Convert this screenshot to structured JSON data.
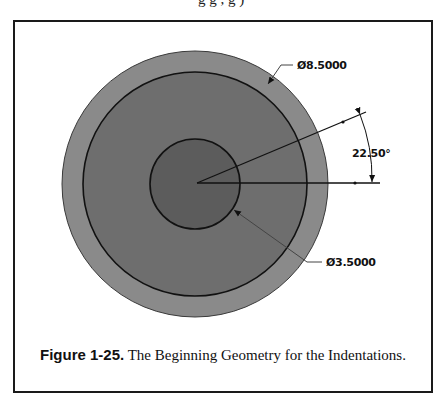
{
  "figure": {
    "caption_label": "Figure 1-25.",
    "caption_text": " The Beginning Geometry for the Indentations.",
    "top_cut_text": "g                                g                              ,  g          )"
  },
  "dimensions": {
    "outer_diameter": "Ø8.5000",
    "inner_diameter": "Ø3.5000",
    "angle": "22.50°"
  },
  "geometry": {
    "center": [
      195,
      184
    ],
    "outer_radius": 133,
    "middle_radius": 112,
    "inner_radius": 45,
    "angle_deg": 22.5
  },
  "colors": {
    "outer_ring": "#8a8a8a",
    "middle_disk": "#6e6e6e",
    "inner_disk": "#5c5c5c",
    "lines": "#111111",
    "leader": "#555555"
  }
}
